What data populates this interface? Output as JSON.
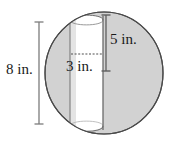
{
  "figure": {
    "shapes": {
      "sphere": {
        "name": "sphere",
        "fill_color": "#d2d2d2",
        "stroke_color": "#4a4a4a",
        "center_x": 104,
        "center_y": 73,
        "radius_x": 59,
        "radius_y": 61
      },
      "cylinder": {
        "name": "inscribed-cylinder",
        "fill_color": "#ffffff",
        "stroke_color": "#6e6e6e",
        "left_x": 70,
        "right_x": 103,
        "top_y": 14,
        "bottom_y": 132
      }
    },
    "dimensions": {
      "diameter": {
        "id": "diameter-dimension",
        "label": "8 in.",
        "value": 8,
        "unit": "in.",
        "orientation": "vertical",
        "position": "left"
      },
      "height": {
        "id": "height-dimension",
        "label": "5 in.",
        "value": 5,
        "unit": "in.",
        "orientation": "vertical",
        "position": "right"
      },
      "radius": {
        "id": "radius-dimension",
        "label": "3 in.",
        "value": 3,
        "unit": "in.",
        "orientation": "horizontal",
        "position": "center",
        "line_style": "dashed"
      }
    },
    "colors": {
      "sphere_fill": "#d2d2d2",
      "cylinder_fill": "#ffffff",
      "outline": "#4a4a4a",
      "dimension_line": "#6a6a6a",
      "dashed_line": "#5a5a5a",
      "text": "#1a1a1a",
      "background": "#ffffff"
    }
  }
}
